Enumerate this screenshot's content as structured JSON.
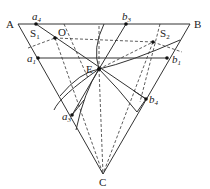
{
  "diagram": {
    "type": "geometry-triangle",
    "vertices": {
      "A": {
        "label": "A",
        "x": 18,
        "y": 24
      },
      "B": {
        "label": "B",
        "x": 190,
        "y": 24
      },
      "C": {
        "label": "C",
        "x": 103,
        "y": 174
      }
    },
    "points": {
      "O": {
        "label": "O",
        "x": 55,
        "y": 38
      },
      "E": {
        "label": "E",
        "x": 99,
        "y": 69
      },
      "S2pt": {
        "x": 153,
        "y": 42
      },
      "a4": {
        "label": "a",
        "sub": "4",
        "x": 36,
        "y": 24
      },
      "b3": {
        "label": "b",
        "sub": "3",
        "x": 126,
        "y": 24
      },
      "a1": {
        "label": "a",
        "sub": "1",
        "x": 38,
        "y": 58
      },
      "b1": {
        "label": "b",
        "sub": "1",
        "x": 167,
        "y": 58
      },
      "a3": {
        "label": "a",
        "sub": "3",
        "x": 72,
        "y": 115
      },
      "b4": {
        "label": "b",
        "sub": "4",
        "x": 146,
        "y": 99
      }
    },
    "regions": {
      "S1": {
        "label": "S",
        "sub": "1"
      },
      "S2": {
        "label": "S",
        "sub": "2"
      }
    }
  }
}
